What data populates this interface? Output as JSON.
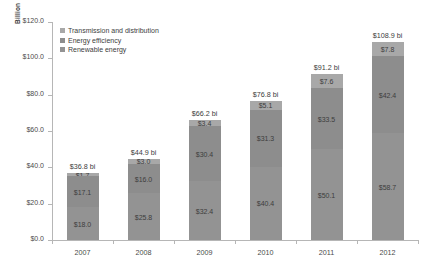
{
  "chart_data": {
    "type": "bar",
    "subtype": "stacked-bar",
    "title": "",
    "xlabel": "",
    "ylabel": "Billion",
    "categories": [
      "2007",
      "2008",
      "2009",
      "2010",
      "2011",
      "2012"
    ],
    "ylim": [
      0,
      120
    ],
    "ytick_step": 20,
    "ytick_labels": [
      "$0.0",
      "$20.0",
      "$40.0",
      "$60.0",
      "$80.0",
      "$100.0",
      "$120.0"
    ],
    "ytick_values": [
      0,
      20,
      40,
      60,
      80,
      100,
      120
    ],
    "grid": false,
    "legend_position": "upper-left-inside",
    "series": [
      {
        "name": "Renewable energy",
        "color": "#939393",
        "values": [
          18.0,
          25.8,
          32.4,
          40.4,
          50.1,
          58.7
        ],
        "labels": [
          "$18.0",
          "$25.8",
          "$32.4",
          "$40.4",
          "$50.1",
          "$58.7"
        ]
      },
      {
        "name": "Energy efficiency",
        "color": "#8d8d8d",
        "values": [
          17.1,
          16.0,
          30.4,
          31.3,
          33.5,
          42.4
        ],
        "labels": [
          "$17.1",
          "$16.0",
          "$30.4",
          "$31.3",
          "$33.5",
          "$42.4"
        ]
      },
      {
        "name": "Transmission and distribution",
        "color": "#a8a8a8",
        "values": [
          1.7,
          3.0,
          3.4,
          5.1,
          7.6,
          7.8
        ],
        "labels": [
          "$1.7",
          "$3.0",
          "$3.4",
          "$5.1",
          "$7.6",
          "$7.8"
        ]
      }
    ],
    "totals": [
      36.8,
      44.9,
      66.2,
      76.8,
      91.2,
      108.9
    ],
    "total_labels": [
      "$36.8 bi",
      "$44.9 bi",
      "$66.2 bi",
      "$76.8 bi",
      "$91.2 bi",
      "$108.9 bi"
    ]
  },
  "legend": {
    "items": [
      {
        "label": "Transmission and distribution",
        "color": "#a8a8a8"
      },
      {
        "label": "Energy efficiency",
        "color": "#8d8d8d"
      },
      {
        "label": "Renewable energy",
        "color": "#939393"
      }
    ]
  },
  "axis": {
    "y_title": "Billion"
  }
}
